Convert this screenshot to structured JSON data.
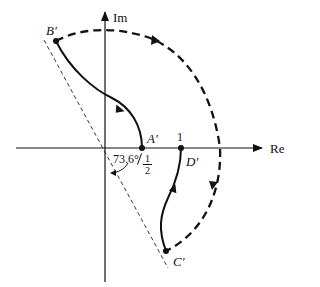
{
  "diagram": {
    "type": "nyquist-contour-mapping",
    "axes": {
      "real_label": "Re",
      "imag_label": "Im"
    },
    "points": [
      {
        "id": "A",
        "label": "A′"
      },
      {
        "id": "B",
        "label": "B′"
      },
      {
        "id": "C",
        "label": "C′"
      },
      {
        "id": "D",
        "label": "D′"
      }
    ],
    "tick_one": "1",
    "half_num": "1",
    "half_den": "2",
    "angle_label": "73.6°",
    "colors": {
      "stroke": "#111111",
      "background": "#ffffff"
    }
  }
}
